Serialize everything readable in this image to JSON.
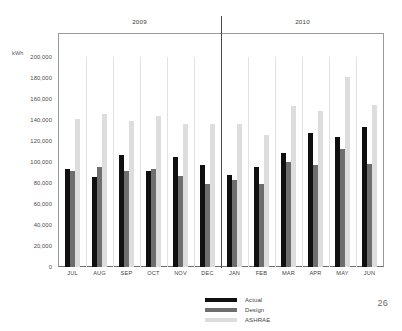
{
  "page": {
    "page_number": "26"
  },
  "axis": {
    "unit_label": "kWh",
    "y_ticks": [
      "200,000",
      "180,000",
      "160,000",
      "140,000",
      "120,000",
      "100,000",
      "80,000",
      "60,000",
      "40,000",
      "20,000",
      "0"
    ]
  },
  "year_headers": [
    {
      "label": "2009"
    },
    {
      "label": "2010"
    }
  ],
  "legend": {
    "items": [
      {
        "label": "Actual",
        "color": "#101010",
        "key": "actual"
      },
      {
        "label": "Design",
        "color": "#6e6e6e",
        "key": "design"
      },
      {
        "label": "ASHRAE",
        "color": "#dddddd",
        "key": "ashrae"
      }
    ]
  },
  "chart_data": {
    "type": "bar",
    "title": "",
    "subtitle": "",
    "xlabel": "",
    "ylabel": "kWh",
    "ylim": [
      0,
      200000
    ],
    "y_tick_step": 20000,
    "grid": "vertical-only",
    "legend_position": "bottom-center",
    "categories": [
      "JUL",
      "AUG",
      "SEP",
      "OCT",
      "NOV",
      "DEC",
      "JAN",
      "FEB",
      "MAR",
      "APR",
      "MAY",
      "JUN"
    ],
    "category_groups": [
      {
        "label": "2009",
        "categories": [
          "JUL",
          "AUG",
          "SEP",
          "OCT",
          "NOV",
          "DEC"
        ]
      },
      {
        "label": "2010",
        "categories": [
          "JAN",
          "FEB",
          "MAR",
          "APR",
          "MAY",
          "JUN"
        ]
      }
    ],
    "series": [
      {
        "name": "Actual",
        "color": "#101010",
        "values": [
          93000,
          86000,
          107000,
          91500,
          105000,
          97000,
          88000,
          95500,
          109000,
          127500,
          124000,
          133500
        ]
      },
      {
        "name": "Design",
        "color": "#6e6e6e",
        "values": [
          91500,
          95000,
          91500,
          93000,
          86500,
          79000,
          83000,
          79500,
          100000,
          97000,
          112500,
          98500
        ]
      },
      {
        "name": "ASHRAE",
        "color": "#dddddd",
        "values": [
          141000,
          146000,
          139000,
          143500,
          136500,
          136500,
          136500,
          125500,
          153500,
          149000,
          181000,
          154000
        ]
      }
    ],
    "annotations": []
  }
}
